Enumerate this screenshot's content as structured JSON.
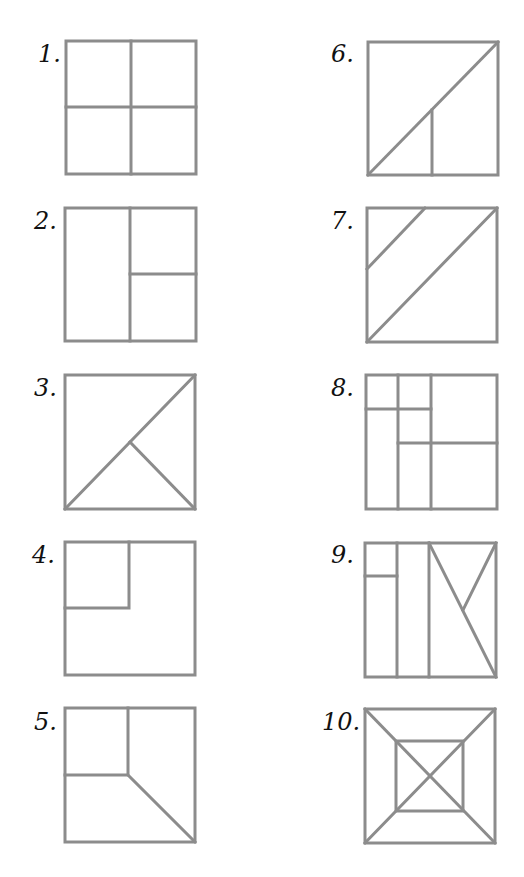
{
  "stroke_color": "#8c8c8c",
  "label_color": "#111111",
  "figures": [
    {
      "label": "1.",
      "description": "square divided into 4 equal quadrants"
    },
    {
      "label": "2.",
      "description": "square split vertically in half, right half split horizontally"
    },
    {
      "label": "3.",
      "description": "square with diagonal and line from center to bottom-right"
    },
    {
      "label": "4.",
      "description": "square with small top-left square inset"
    },
    {
      "label": "5.",
      "description": "square with top-left quarter and diagonal to bottom-right"
    },
    {
      "label": "6.",
      "description": "square with diagonal and vertical line from bottom midpoint"
    },
    {
      "label": "7.",
      "description": "square with diagonal and parallel line cutting top-left corner"
    },
    {
      "label": "8.",
      "description": "square divided into grid of rectangles"
    },
    {
      "label": "9.",
      "description": "square with vertical strips and N-shaped diagonals"
    },
    {
      "label": "10.",
      "description": "square with inner square and both diagonals"
    }
  ]
}
